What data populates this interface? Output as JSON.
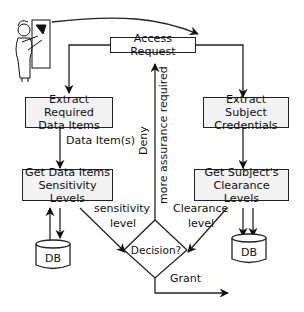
{
  "diagram": {
    "nodes": {
      "user": {
        "icon": "person-at-terminal-icon"
      },
      "access_request": "Access Request",
      "extract_required": {
        "line1": "Extract Required",
        "line2": "Data Items"
      },
      "get_sensitivity": {
        "line1": "Get Data Items",
        "line2": "Sensitivity Levels"
      },
      "extract_subject": {
        "line1": "Extract Subject",
        "line2": "Credentials"
      },
      "get_clearance": {
        "line1": "Get Subject's",
        "line2": "Clearance Levels"
      },
      "db_left": "DB",
      "db_right": "DB",
      "decision": "Decision?"
    },
    "edge_labels": {
      "data_items": "Data Item(s)",
      "sensitivity_line1": "sensitivity",
      "sensitivity_line2": "level",
      "clearance_line1": "Clearance",
      "clearance_line2": "level",
      "deny": "Deny",
      "more_assurance": "more assurance required",
      "grant": "Grant"
    },
    "colors": {
      "stroke": "#222222",
      "box_fill": "#f2f2f2",
      "text": "#111111"
    }
  }
}
